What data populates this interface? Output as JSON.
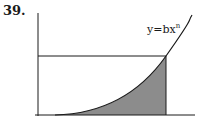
{
  "problem_number": "39.",
  "curve_label": {
    "base": "y=bx",
    "exponent": "n"
  },
  "colors": {
    "ink": "#1a1a1a",
    "shade": "#8c8c8c",
    "background": "#ffffff"
  },
  "figure": {
    "y_axis": {
      "x": 38,
      "y_top": 13,
      "y_bottom": 116
    },
    "x_axis": {
      "y": 115,
      "x_left": 35,
      "x_right": 195
    },
    "horizontal_line": {
      "y": 56,
      "x_left": 38,
      "x_right": 166
    },
    "vertical_line": {
      "x": 166,
      "y_top": 56,
      "y_bottom": 115
    }
  }
}
